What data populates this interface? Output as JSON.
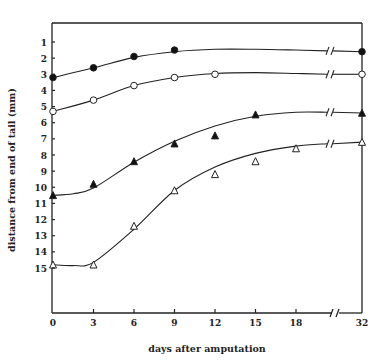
{
  "chart_data": {
    "type": "line",
    "title": "",
    "xlabel": "days after amputation",
    "ylabel": "distance from end of tail (mm)",
    "x_ticks": [
      0,
      3,
      6,
      9,
      12,
      15,
      18,
      32
    ],
    "y_ticks": [
      1,
      2,
      3,
      4,
      5,
      6,
      7,
      8,
      9,
      10,
      11,
      12,
      13,
      14,
      15
    ],
    "xlim": [
      0,
      32
    ],
    "ylim": [
      16,
      0
    ],
    "y_inverted": true,
    "x_axis_break": {
      "between": [
        18,
        32
      ]
    },
    "grid": false,
    "legend": null,
    "series": [
      {
        "name": "filled-circle",
        "marker": "circle-filled",
        "x": [
          0,
          3,
          6,
          9,
          32
        ],
        "y": [
          3.2,
          2.6,
          1.9,
          1.5,
          1.6
        ]
      },
      {
        "name": "open-circle",
        "marker": "circle-open",
        "x": [
          0,
          3,
          6,
          9,
          12,
          32
        ],
        "y": [
          5.3,
          4.6,
          3.7,
          3.2,
          3.0,
          3.0
        ]
      },
      {
        "name": "filled-triangle",
        "marker": "triangle-filled",
        "x": [
          0,
          3,
          6,
          9,
          12,
          15,
          32
        ],
        "y": [
          10.5,
          9.8,
          8.4,
          7.3,
          6.8,
          5.5,
          5.4
        ]
      },
      {
        "name": "open-triangle",
        "marker": "triangle-open",
        "x": [
          0,
          3,
          6,
          9,
          12,
          15,
          18,
          32
        ],
        "y": [
          14.8,
          14.8,
          12.4,
          10.2,
          9.2,
          8.4,
          7.6,
          7.2
        ]
      }
    ],
    "fitted_curves": [
      {
        "series": "filled-circle",
        "x": [
          0,
          3,
          6,
          9,
          12,
          15,
          18,
          20.5,
          32
        ],
        "y": [
          3.2,
          2.6,
          1.95,
          1.6,
          1.45,
          1.45,
          1.5,
          1.55,
          1.6
        ]
      },
      {
        "series": "open-circle",
        "x": [
          0,
          3,
          6,
          9,
          12,
          15,
          18,
          20.5,
          32
        ],
        "y": [
          5.3,
          4.6,
          3.7,
          3.2,
          2.95,
          2.9,
          2.95,
          3.0,
          3.0
        ]
      },
      {
        "series": "filled-triangle",
        "x": [
          0,
          1.5,
          3,
          6,
          9,
          12,
          15,
          18,
          20.5,
          32
        ],
        "y": [
          10.5,
          10.4,
          10.05,
          8.45,
          7.15,
          6.2,
          5.6,
          5.35,
          5.35,
          5.4
        ]
      },
      {
        "series": "open-triangle",
        "x": [
          0,
          1.5,
          3,
          6,
          9,
          12,
          15,
          18,
          20.5,
          32
        ],
        "y": [
          14.8,
          14.85,
          14.65,
          12.6,
          10.2,
          8.75,
          7.9,
          7.45,
          7.3,
          7.2
        ]
      }
    ]
  },
  "labels": {
    "xlabel": "days after amputation",
    "ylabel": "distance from end of tail (mm)"
  }
}
